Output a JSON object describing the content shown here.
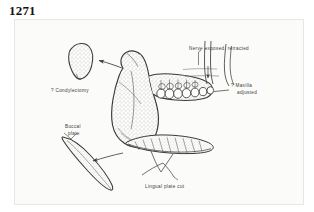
{
  "figure": {
    "number": "1271"
  },
  "plate": {
    "background_color": "#fbfbfa",
    "ink_color": "#3a3a38",
    "annotations": {
      "condylectomy": "? Condylectomy",
      "nerve": "Nerve exposed, retracted",
      "maxilla_line1": "? Maxilla",
      "maxilla_line2": "adjusted",
      "buccal_line1": "Buccal",
      "buccal_line2": "plate",
      "lingual": "Lingual plate cut"
    },
    "structures": {
      "condyle_fragment": "condyle-fragment",
      "mandible": "mandible-body",
      "ramus": "mandibular-ramus",
      "teeth": "teeth-row",
      "buccal_plate": "buccal-plate-fragment",
      "lingual_plate": "lingual-plate-cut",
      "nerve_bundle": "inferior-alveolar-nerve"
    }
  }
}
